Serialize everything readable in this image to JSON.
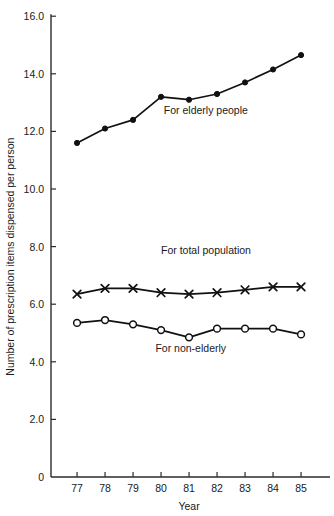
{
  "chart_data": {
    "type": "line",
    "title": "",
    "xlabel": "Year",
    "ylabel": "Number of prescription items dispensed per person",
    "categories": [
      "77",
      "78",
      "79",
      "80",
      "81",
      "82",
      "83",
      "84",
      "85"
    ],
    "x": [
      77,
      78,
      79,
      80,
      81,
      82,
      83,
      84,
      85
    ],
    "xlim": [
      76.1,
      86.0
    ],
    "ylim": [
      0,
      16.0
    ],
    "grid": false,
    "legend_position": "inline-annotations",
    "y_ticks": [
      0,
      2.0,
      4.0,
      6.0,
      8.0,
      10.0,
      12.0,
      14.0,
      16.0
    ],
    "y_tick_labels": [
      "0",
      "2.0",
      "4.0",
      "6.0",
      "8.0",
      "10.0",
      "12.0",
      "14.0",
      "16.0"
    ],
    "x_ticks": [
      77,
      78,
      79,
      80,
      81,
      82,
      83,
      84,
      85
    ],
    "x_tick_labels": [
      "77",
      "78",
      "79",
      "80",
      "81",
      "82",
      "83",
      "84",
      "85"
    ],
    "series": [
      {
        "name": "For elderly people",
        "marker": "filled-circle",
        "values": [
          11.6,
          12.1,
          12.4,
          13.2,
          13.1,
          13.3,
          13.7,
          14.15,
          14.65
        ]
      },
      {
        "name": "For total population",
        "marker": "x-cross",
        "values": [
          6.35,
          6.55,
          6.55,
          6.4,
          6.35,
          6.4,
          6.5,
          6.6,
          6.6
        ]
      },
      {
        "name": "For non-elderly",
        "marker": "open-circle",
        "values": [
          5.35,
          5.45,
          5.3,
          5.1,
          4.85,
          5.15,
          5.15,
          5.15,
          4.95
        ]
      }
    ],
    "annotations": [
      {
        "text": "For elderly people",
        "x": 80.1,
        "y": 12.6
      },
      {
        "text": "For total population",
        "x": 80.0,
        "y": 7.75
      },
      {
        "text": "For non-elderly",
        "x": 79.8,
        "y": 4.35
      }
    ],
    "colors": {
      "axis": "#2b2b2b",
      "series_line": "#111111",
      "text": "#1a1a1a",
      "background": "#ffffff"
    }
  }
}
